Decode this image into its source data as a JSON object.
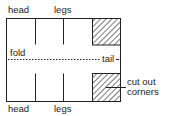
{
  "diagram": {
    "type": "cut-and-fold paper template",
    "labels": {
      "head_top": "head",
      "legs_top": "legs",
      "fold": "fold",
      "tail": "tail",
      "cut_out_line1": "cut out",
      "cut_out_line2": "corners",
      "head_bottom": "head",
      "legs_bottom": "legs"
    },
    "colors": {
      "line": "#222222",
      "background": "#ffffff"
    },
    "elements": {
      "outline": "rectangle",
      "cut_lines": 4,
      "fold_line": "dashed horizontal",
      "hatched_corners": 2
    }
  }
}
